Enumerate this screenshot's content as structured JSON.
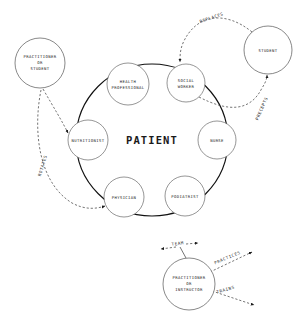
{
  "diagram": {
    "title": "PATIENT",
    "center": {
      "label": "PATIENT"
    },
    "inner_nodes": [
      {
        "id": "health-professional",
        "line1": "HEALTH",
        "line2": "PROFESSIONAL",
        "cx": 128,
        "cy": 84,
        "r": 21
      },
      {
        "id": "social-worker",
        "line1": "SOCIAL",
        "line2": "WORKER",
        "cx": 186,
        "cy": 83,
        "r": 19
      },
      {
        "id": "nutritionist",
        "line1": "NUTRITIONIST",
        "line2": "",
        "cx": 88,
        "cy": 140,
        "r": 20
      },
      {
        "id": "nurse",
        "line1": "NURSE",
        "line2": "",
        "cx": 217,
        "cy": 140,
        "r": 19
      },
      {
        "id": "physician",
        "line1": "PHYSICIAN",
        "line2": "",
        "cx": 124,
        "cy": 197,
        "r": 20
      },
      {
        "id": "podiatrist",
        "line1": "PODIATRIST",
        "line2": "",
        "cx": 185,
        "cy": 196,
        "r": 20
      }
    ],
    "external_nodes": [
      {
        "id": "practitioner-or-student",
        "line1": "PRACTITIONER",
        "line2": "OR",
        "line3": "STUDENT",
        "cx": 40,
        "cy": 63,
        "r": 25
      },
      {
        "id": "student",
        "line1": "STUDENT",
        "line2": "",
        "line3": "",
        "cx": 268,
        "cy": 50,
        "r": 24
      },
      {
        "id": "practitioner-or-instructor",
        "line1": "PRACTITIONER",
        "line2": "OR",
        "line3": "INSTRUCTOR",
        "cx": 189,
        "cy": 284,
        "r": 26
      }
    ],
    "edges": [
      {
        "id": "replaces",
        "label": "REPLACES",
        "x": 212,
        "y": 19,
        "rotate": -19
      },
      {
        "id": "precepts",
        "label": "PRECEPTS",
        "x": 263,
        "y": 109,
        "rotate": -66
      },
      {
        "id": "rotates",
        "label": "ROTATES",
        "x": 44,
        "y": 166,
        "rotate": -73
      },
      {
        "id": "team",
        "label": "TEAM",
        "x": 178,
        "y": 245,
        "rotate": -8
      },
      {
        "id": "practices",
        "label": "PRACTICES",
        "x": 228,
        "y": 259,
        "rotate": -23
      },
      {
        "id": "trains",
        "label": "TRAINS",
        "x": 226,
        "y": 291,
        "rotate": -16
      }
    ],
    "colors": {
      "ink": "#111111",
      "sub_stroke": "#5c5c5c",
      "dash_stroke": "#3a3a3a",
      "background": "#ffffff"
    }
  }
}
